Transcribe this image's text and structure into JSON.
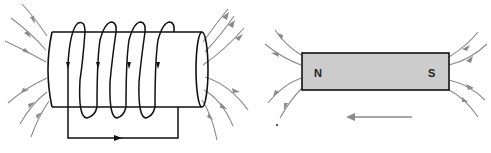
{
  "figure": {
    "left_panel": {
      "subject": "solenoid",
      "coil_loops": 4,
      "current_direction_in_return_wire": "right",
      "field_lines_left_side": 6,
      "field_lines_right_side": 7,
      "field_line_direction": "left-to-right (entering left end, exiting right end)"
    },
    "right_panel": {
      "subject": "bar-magnet",
      "north_label": "N",
      "south_label": "S",
      "field_lines_left_side": 4,
      "field_lines_right_side": 4,
      "motion_arrow_direction": "left"
    },
    "colors": {
      "field_line": "#8a8a8a",
      "wire": "#111111",
      "magnet_fill": "#cccccc",
      "background": "#ffffff"
    }
  }
}
